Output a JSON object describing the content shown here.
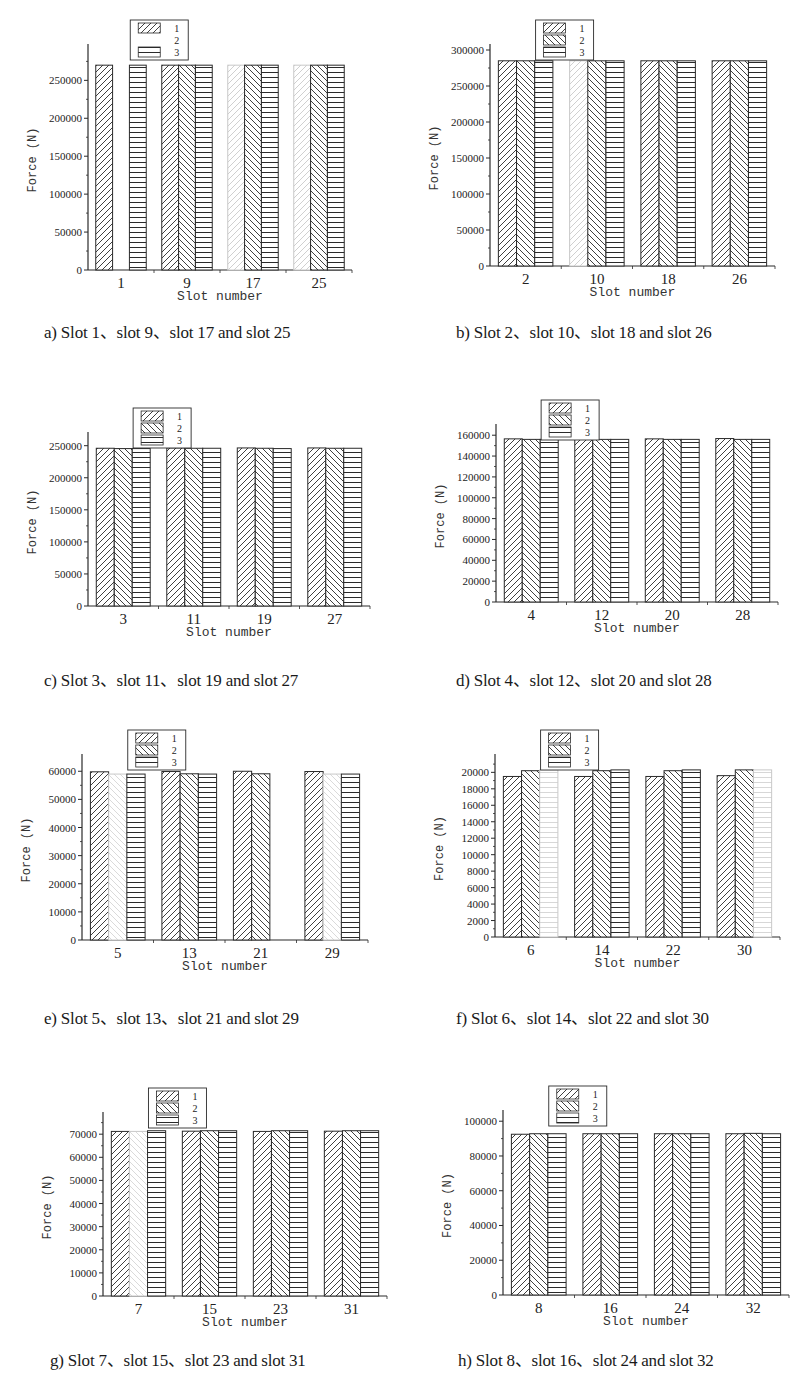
{
  "figure": {
    "legend_labels": [
      "1",
      "2",
      "3"
    ],
    "colors": {
      "ink": "#2a2a2a",
      "faded": "#bdbdbd",
      "background": "#ffffff"
    }
  },
  "chart_data": [
    {
      "type": "bar",
      "id": "a",
      "caption": "a) Slot 1、slot 9、slot 17 and slot 25",
      "xlabel": "Slot number",
      "ylabel": "Force (N)",
      "categories": [
        "1",
        "9",
        "17",
        "25"
      ],
      "ylim": [
        0,
        290000
      ],
      "yticks": [
        0,
        50000,
        100000,
        150000,
        200000,
        250000
      ],
      "series": [
        {
          "name": "1",
          "values": [
            270000,
            270000,
            270000,
            270000
          ],
          "faded": [
            false,
            false,
            true,
            true
          ]
        },
        {
          "name": "2",
          "values": [
            270000,
            270000,
            270000,
            270000
          ],
          "faded": [
            true,
            false,
            false,
            false
          ],
          "hidden": [
            true,
            false,
            false,
            false
          ]
        },
        {
          "name": "3",
          "values": [
            270000,
            270000,
            270000,
            270000
          ],
          "faded": [
            false,
            false,
            false,
            false
          ]
        }
      ],
      "legend_hidden": [
        false,
        true,
        false
      ],
      "legend_position": "top-center",
      "grid": false
    },
    {
      "type": "bar",
      "id": "b",
      "caption": "b) Slot 2、slot 10、slot 18 and slot 26",
      "xlabel": "Slot number",
      "ylabel": "Force (N)",
      "categories": [
        "2",
        "10",
        "18",
        "26"
      ],
      "ylim": [
        0,
        300000
      ],
      "yticks": [
        0,
        50000,
        100000,
        150000,
        200000,
        250000,
        300000
      ],
      "series": [
        {
          "name": "1",
          "values": [
            285000,
            285000,
            285000,
            285000
          ],
          "faded": [
            false,
            true,
            false,
            false
          ]
        },
        {
          "name": "2",
          "values": [
            285000,
            285000,
            285000,
            285000
          ],
          "faded": [
            false,
            false,
            false,
            false
          ]
        },
        {
          "name": "3",
          "values": [
            285000,
            285000,
            285000,
            285000
          ],
          "faded": [
            false,
            false,
            false,
            false
          ]
        }
      ],
      "legend_hidden": [
        false,
        false,
        false
      ],
      "legend_position": "top-center",
      "grid": false
    },
    {
      "type": "bar",
      "id": "c",
      "caption": "c) Slot 3、slot 11、slot 19 and slot 27",
      "xlabel": "Slot number",
      "ylabel": "Force (N)",
      "categories": [
        "3",
        "11",
        "19",
        "27"
      ],
      "ylim": [
        0,
        262000
      ],
      "yticks": [
        0,
        50000,
        100000,
        150000,
        200000,
        250000
      ],
      "series": [
        {
          "name": "1",
          "values": [
            246000,
            246500,
            246500,
            246500
          ],
          "faded": [
            false,
            false,
            false,
            false
          ]
        },
        {
          "name": "2",
          "values": [
            245500,
            246000,
            246000,
            246000
          ],
          "faded": [
            false,
            false,
            false,
            false
          ]
        },
        {
          "name": "3",
          "values": [
            245500,
            246000,
            245500,
            246000
          ],
          "faded": [
            false,
            false,
            false,
            false
          ]
        }
      ],
      "legend_hidden": [
        false,
        false,
        false
      ],
      "legend_position": "top-center",
      "grid": false
    },
    {
      "type": "bar",
      "id": "d",
      "caption": "d) Slot 4、slot 12、slot 20 and slot 28",
      "xlabel": "Slot number",
      "ylabel": "Force (N)",
      "categories": [
        "4",
        "12",
        "20",
        "28"
      ],
      "ylim": [
        0,
        165000
      ],
      "yticks": [
        0,
        20000,
        40000,
        60000,
        80000,
        100000,
        120000,
        140000,
        160000
      ],
      "series": [
        {
          "name": "1",
          "values": [
            156500,
            156500,
            156500,
            156800
          ],
          "faded": [
            false,
            false,
            false,
            false
          ]
        },
        {
          "name": "2",
          "values": [
            156000,
            156000,
            156000,
            156000
          ],
          "faded": [
            false,
            false,
            false,
            false
          ]
        },
        {
          "name": "3",
          "values": [
            156000,
            156000,
            156000,
            156000
          ],
          "faded": [
            false,
            false,
            false,
            false
          ]
        }
      ],
      "legend_hidden": [
        false,
        false,
        false
      ],
      "legend_position": "top-center",
      "grid": false
    },
    {
      "type": "bar",
      "id": "e",
      "caption": "e) Slot 5、slot 13、slot 21 and slot 29",
      "xlabel": "Slot number",
      "ylabel": "Force (N)",
      "categories": [
        "5",
        "13",
        "21",
        "29"
      ],
      "ylim": [
        0,
        64000
      ],
      "yticks": [
        0,
        10000,
        20000,
        30000,
        40000,
        50000,
        60000
      ],
      "series": [
        {
          "name": "1",
          "values": [
            59800,
            59900,
            60000,
            59900
          ],
          "faded": [
            false,
            false,
            false,
            false
          ]
        },
        {
          "name": "2",
          "values": [
            59000,
            59100,
            59100,
            59000
          ],
          "faded": [
            true,
            false,
            false,
            true
          ]
        },
        {
          "name": "3",
          "values": [
            59000,
            59000,
            59000,
            59000
          ],
          "faded": [
            false,
            false,
            true,
            false
          ],
          "hidden": [
            false,
            false,
            true,
            false
          ]
        }
      ],
      "legend_hidden": [
        false,
        false,
        false
      ],
      "legend_position": "top-center",
      "grid": false
    },
    {
      "type": "bar",
      "id": "f",
      "caption": "f) Slot 6、slot 14、slot 22 and slot 30",
      "xlabel": "Slot number",
      "ylabel": "Force (N)",
      "categories": [
        "6",
        "14",
        "22",
        "30"
      ],
      "ylim": [
        0,
        21500
      ],
      "yticks": [
        0,
        2000,
        4000,
        6000,
        8000,
        10000,
        12000,
        14000,
        16000,
        18000,
        20000
      ],
      "series": [
        {
          "name": "1",
          "values": [
            19500,
            19500,
            19500,
            19600
          ],
          "faded": [
            false,
            false,
            false,
            false
          ]
        },
        {
          "name": "2",
          "values": [
            20200,
            20200,
            20200,
            20300
          ],
          "faded": [
            false,
            false,
            false,
            false
          ]
        },
        {
          "name": "3",
          "values": [
            20300,
            20300,
            20300,
            20300
          ],
          "faded": [
            true,
            false,
            false,
            true
          ]
        }
      ],
      "legend_hidden": [
        false,
        false,
        false
      ],
      "legend_position": "top-center",
      "grid": false
    },
    {
      "type": "bar",
      "id": "g",
      "caption": "g) Slot 7、slot 15、slot 23 and slot 31",
      "xlabel": "Slot number",
      "ylabel": "Force (N)",
      "categories": [
        "7",
        "15",
        "23",
        "31"
      ],
      "ylim": [
        0,
        77000
      ],
      "yticks": [
        0,
        10000,
        20000,
        30000,
        40000,
        50000,
        60000,
        70000
      ],
      "series": [
        {
          "name": "1",
          "values": [
            71200,
            71300,
            71200,
            71300
          ],
          "faded": [
            false,
            false,
            false,
            false
          ]
        },
        {
          "name": "2",
          "values": [
            71200,
            71500,
            71500,
            71500
          ],
          "faded": [
            true,
            false,
            false,
            false
          ]
        },
        {
          "name": "3",
          "values": [
            71500,
            71500,
            71500,
            71500
          ],
          "faded": [
            false,
            false,
            false,
            false
          ]
        }
      ],
      "legend_hidden": [
        false,
        false,
        false
      ],
      "legend_position": "top-center",
      "grid": false
    },
    {
      "type": "bar",
      "id": "h",
      "caption": "h) Slot 8、slot 16、slot 24 and slot 32",
      "xlabel": "Slot number",
      "ylabel": "Force (N)",
      "categories": [
        "8",
        "16",
        "24",
        "32"
      ],
      "ylim": [
        0,
        103000
      ],
      "yticks": [
        0,
        20000,
        40000,
        60000,
        80000,
        100000
      ],
      "series": [
        {
          "name": "1",
          "values": [
            92500,
            92800,
            92800,
            92800
          ],
          "faded": [
            false,
            false,
            false,
            false
          ]
        },
        {
          "name": "2",
          "values": [
            92800,
            92800,
            92800,
            93000
          ],
          "faded": [
            false,
            false,
            false,
            false
          ]
        },
        {
          "name": "3",
          "values": [
            92800,
            92800,
            92800,
            92800
          ],
          "faded": [
            false,
            false,
            false,
            false
          ]
        }
      ],
      "legend_hidden": [
        false,
        false,
        false
      ],
      "legend_position": "top-center",
      "grid": false
    }
  ]
}
